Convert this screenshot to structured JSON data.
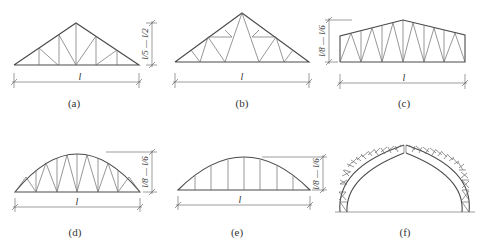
{
  "figure": {
    "panels": [
      {
        "id": "a",
        "caption": "(a)",
        "type": "triangular truss (fan web)",
        "span_label": "l",
        "height_label": "l/5 — l/2"
      },
      {
        "id": "b",
        "caption": "(b)",
        "type": "triangular truss (sub-divided web)",
        "span_label": "l",
        "height_label": "l/8 — l/6"
      },
      {
        "id": "c",
        "caption": "(c)",
        "type": "trapezoidal truss",
        "span_label": "l",
        "height_label": "l/8 — l/6"
      },
      {
        "id": "d",
        "caption": "(d)",
        "type": "arched (bowstring) truss with diagonals",
        "span_label": "l",
        "height_label": "l/8 — l/6"
      },
      {
        "id": "e",
        "caption": "(e)",
        "type": "arched truss with verticals only",
        "span_label": "l",
        "height_label": "l/8 — l/6"
      },
      {
        "id": "f",
        "caption": "(f)",
        "type": "lattice arch (three-hinged)",
        "span_label": "",
        "height_label": ""
      }
    ]
  },
  "colors": {
    "line": "#4a4a4a",
    "web": "#6a6a6a",
    "background": "#ffffff"
  }
}
